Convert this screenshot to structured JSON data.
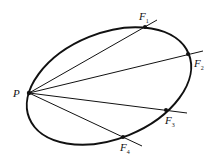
{
  "diagram": {
    "labels": {
      "P": "P",
      "F1": {
        "main": "F",
        "sub": "1"
      },
      "F2": {
        "main": "F",
        "sub": "2"
      },
      "F3": {
        "main": "F",
        "sub": "3"
      },
      "F4": {
        "main": "F",
        "sub": "4"
      }
    },
    "colors": {
      "stroke": "#111111",
      "background": "#ffffff"
    }
  }
}
